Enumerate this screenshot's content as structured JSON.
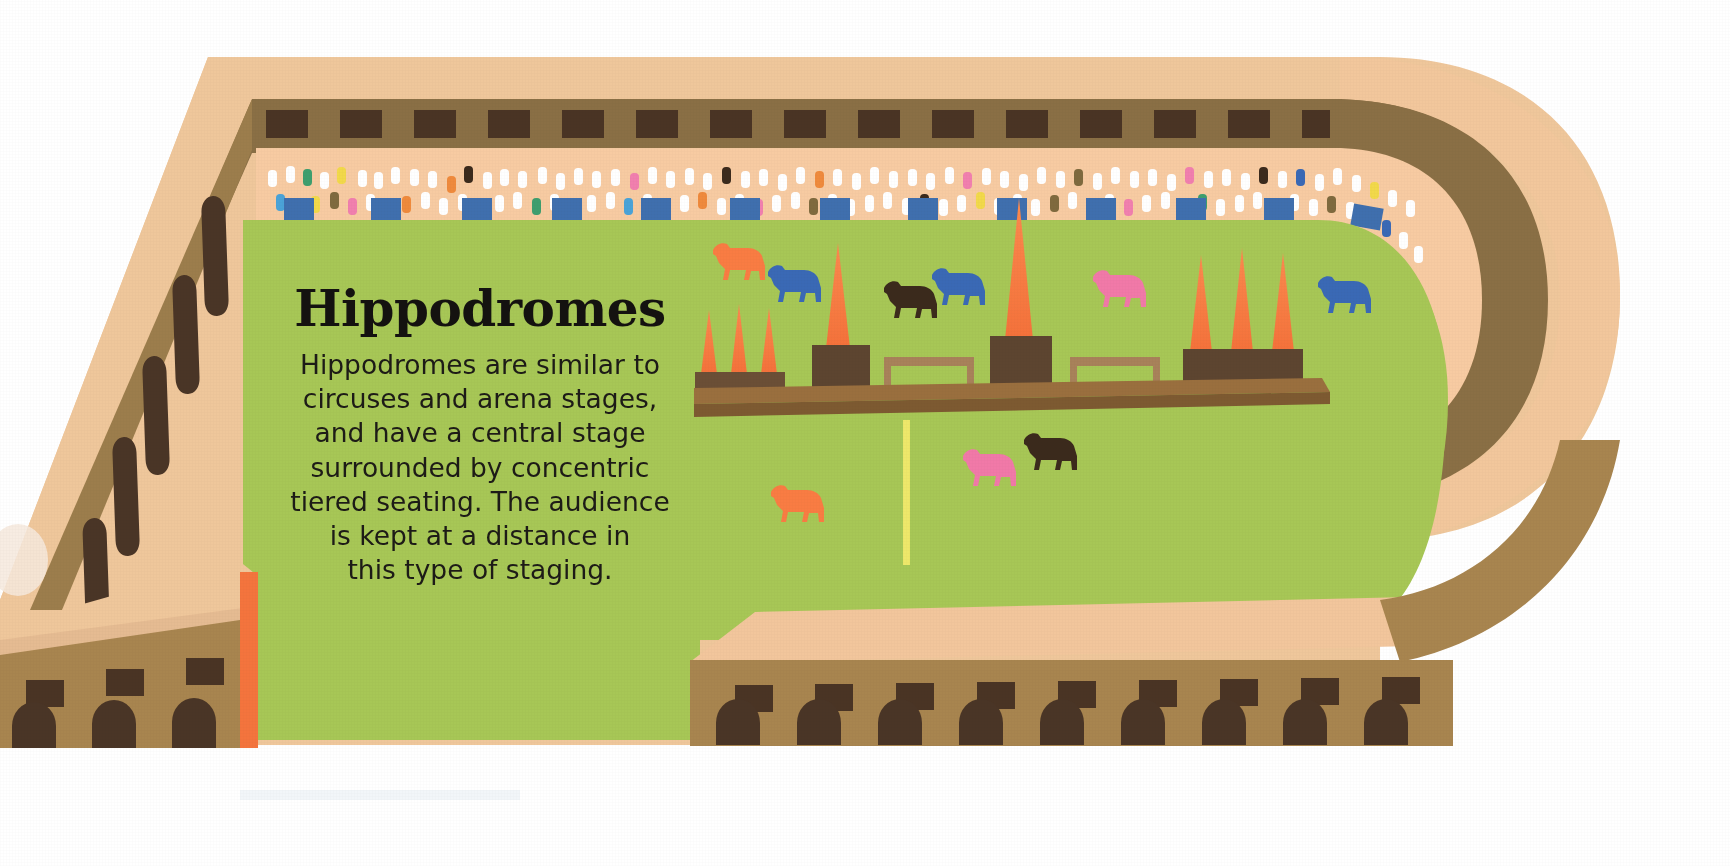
{
  "illustration": {
    "title": "Hippodromes",
    "body": "Hippodromes are similar to\ncircuses and arena stages,\nand have a central stage\nsurrounded by concentric\ntiered seating. The audience\nis kept at a distance in\nthis type of staging.",
    "subject": "hippodrome-diagram"
  },
  "colors": {
    "background": "#ffffff",
    "outer_rim_light": "#efc79b",
    "outer_rim_peach": "#f2c79c",
    "wall_dark_brown": "#8a6f45",
    "wall_mid_brown": "#a8854f",
    "wall_shadow_brown": "#7d6340",
    "window_dark": "#4a3424",
    "arch_dark": "#4a3526",
    "seating_peach": "#f7cba2",
    "field_green": "#a7c756",
    "field_green_light": "#b0cc5f",
    "obelisk_orange": "#f97c43",
    "obelisk_base_brown": "#6b4f36",
    "spina_brown": "#8a6136",
    "spina_top": "#9a6f3e",
    "center_line_yellow": "#eee86a",
    "seat_blue": "#3f6fae",
    "horse_orange": "#f97c43",
    "horse_blue": "#3a69b5",
    "horse_dark": "#3b2a1c",
    "horse_pink": "#f179a8",
    "accent_orange_strip": "#f4743d",
    "text_dark": "#1d1b17"
  },
  "scene": {
    "arena_name": "hippodrome-arena",
    "track_surface": "field",
    "center_line": "yellow-center-line",
    "spina": {
      "name": "central-stage-spina",
      "obelisk_groups": [
        {
          "name": "left-obelisk-group",
          "count": 3
        },
        {
          "name": "center-obelisk",
          "count": 1
        },
        {
          "name": "right-obelisk-group",
          "count": 3
        }
      ],
      "benches": 2
    },
    "horses": [
      {
        "name": "horse-orange-upper-left",
        "color": "#f97c43"
      },
      {
        "name": "horse-blue-upper-left",
        "color": "#3a69b5"
      },
      {
        "name": "horse-dark-upper-mid",
        "color": "#3b2a1c"
      },
      {
        "name": "horse-blue-upper-mid",
        "color": "#3a69b5"
      },
      {
        "name": "horse-pink-upper-right",
        "color": "#f179a8"
      },
      {
        "name": "horse-blue-upper-far-right",
        "color": "#3a69b5"
      },
      {
        "name": "horse-dark-lower-mid",
        "color": "#3b2a1c"
      },
      {
        "name": "horse-pink-lower-mid",
        "color": "#f179a8"
      },
      {
        "name": "horse-orange-lower-left",
        "color": "#f97c43"
      }
    ],
    "seating": {
      "name": "tiered-seating-band",
      "crowd_description": "multicolored spectator dots",
      "seat_blocks": "blue seat blocks"
    },
    "architecture": {
      "top_wall_windows": 20,
      "bottom_wall_windows": 14,
      "bottom_wall_arches": 13,
      "left_wall_arches": 5
    }
  }
}
